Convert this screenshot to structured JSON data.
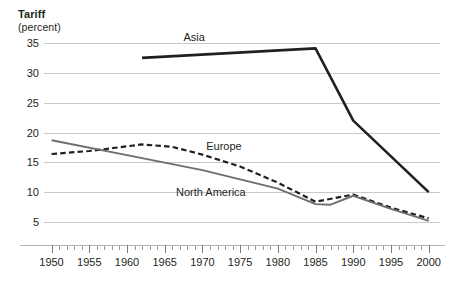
{
  "chart_data": {
    "type": "line",
    "title": "Tariff",
    "subtitle": "(percent)",
    "xlabel": "",
    "ylabel": "Tariff (percent)",
    "xlim": [
      1949,
      2001.5
    ],
    "ylim": [
      5,
      35
    ],
    "grid": true,
    "grid_axis": "y",
    "legend_position": "inline-labels",
    "y_ticks": [
      35,
      30,
      25,
      20,
      15,
      10,
      5
    ],
    "x_ticks_major": [
      1950,
      1955,
      1960,
      1965,
      1970,
      1975,
      1980,
      1985,
      1990,
      1995,
      2000
    ],
    "x_tick_labels": [
      "1950",
      "1955",
      "1960",
      "1965",
      "1970",
      "1975",
      "1980",
      "1985",
      "1990",
      "1995",
      "2000"
    ],
    "x_minor_tick_interval": 1,
    "series": [
      {
        "name": "Asia",
        "style": "solid",
        "color": "#231f20",
        "width": 2.6,
        "label_x": 1967.5,
        "label_y": 35.9,
        "x": [
          1962,
          1985,
          1990,
          2000
        ],
        "values": [
          32.5,
          34.1,
          22.0,
          10.0
        ]
      },
      {
        "name": "Europe",
        "style": "dashed",
        "color": "#231f20",
        "width": 2.2,
        "label_x": 1970.5,
        "label_y": 17.6,
        "x": [
          1950,
          1955,
          1962,
          1966,
          1970,
          1975,
          1980,
          1985,
          1990,
          1995,
          2000
        ],
        "values": [
          16.4,
          16.9,
          18.0,
          17.6,
          16.3,
          14.3,
          11.6,
          8.4,
          9.6,
          7.4,
          5.6
        ]
      },
      {
        "name": "North America",
        "style": "solid",
        "color": "#6d6e71",
        "width": 1.9,
        "label_x": 1966.5,
        "label_y": 9.9,
        "x": [
          1950,
          1960,
          1970,
          1980,
          1985,
          1987,
          1990,
          1995,
          2000
        ],
        "values": [
          18.7,
          16.2,
          13.7,
          10.6,
          8.0,
          7.9,
          9.4,
          7.2,
          5.2
        ]
      }
    ]
  }
}
